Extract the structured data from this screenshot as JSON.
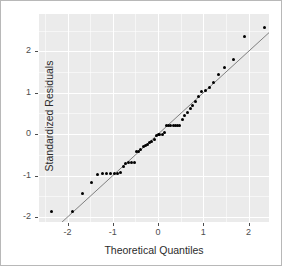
{
  "chart_data": {
    "type": "scatter",
    "title": "",
    "xlabel": "Theoretical Quantiles",
    "ylabel": "Standardized Residuals",
    "xlim": [
      -2.63,
      2.45
    ],
    "ylim": [
      -2.12,
      2.9
    ],
    "xticks": [
      -2,
      -1,
      0,
      1,
      2
    ],
    "xticklabels": [
      "-2",
      "-1",
      "0",
      "1",
      "2"
    ],
    "yticks": [
      -2,
      -1,
      0,
      1,
      2
    ],
    "yticklabels": [
      "-2",
      "-1",
      "0",
      "1",
      "2"
    ],
    "grid": true,
    "grid_color": "#ffffff",
    "panel_background": "#ebebeb",
    "legend": "none",
    "point_color": "#000000",
    "point_size": 3,
    "reference_line": {
      "type": "qq-line",
      "color": "#737373",
      "slope": 1.0,
      "intercept": 0.0,
      "x_start": -2.63,
      "x_end": 2.45
    },
    "x": [
      -2.35,
      -1.9,
      -1.66,
      -1.47,
      -1.33,
      -1.22,
      -1.13,
      -1.05,
      -0.97,
      -0.9,
      -0.83,
      -0.77,
      -0.71,
      -0.65,
      -0.59,
      -0.53,
      -0.48,
      -0.43,
      -0.38,
      -0.33,
      -0.28,
      -0.23,
      -0.18,
      -0.14,
      -0.09,
      -0.04,
      0.0,
      0.04,
      0.09,
      0.14,
      0.18,
      0.23,
      0.28,
      0.33,
      0.38,
      0.43,
      0.48,
      0.53,
      0.59,
      0.65,
      0.71,
      0.77,
      0.83,
      0.9,
      0.97,
      1.05,
      1.13,
      1.22,
      1.33,
      1.47,
      1.66,
      1.9,
      2.35
    ],
    "y": [
      -1.87,
      -1.87,
      -1.42,
      -1.16,
      -0.97,
      -0.95,
      -0.95,
      -0.95,
      -0.95,
      -0.94,
      -0.93,
      -0.78,
      -0.72,
      -0.68,
      -0.68,
      -0.68,
      -0.43,
      -0.42,
      -0.36,
      -0.3,
      -0.28,
      -0.26,
      -0.2,
      -0.18,
      -0.12,
      -0.04,
      -0.02,
      -0.01,
      0.0,
      0.04,
      0.22,
      0.22,
      0.22,
      0.22,
      0.22,
      0.22,
      0.22,
      0.36,
      0.46,
      0.52,
      0.62,
      0.7,
      0.8,
      0.9,
      1.02,
      1.05,
      1.12,
      1.25,
      1.44,
      1.62,
      1.8,
      2.35,
      2.58
    ]
  },
  "axes": {
    "x_label": "Theoretical Quantiles",
    "y_label": "Standardized Residuals",
    "x_tick_labels": [
      "-2",
      "-1",
      "0",
      "1",
      "2"
    ],
    "y_tick_labels": [
      "-2",
      "-1",
      "0",
      "1",
      "2"
    ]
  }
}
